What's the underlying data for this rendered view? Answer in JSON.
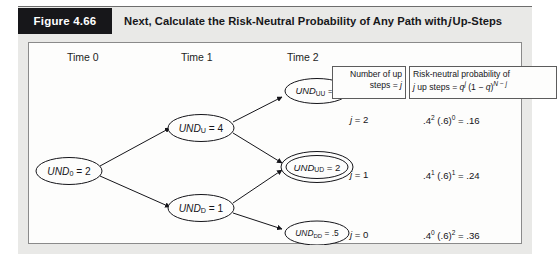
{
  "figure": {
    "tag": "Figure 4.66",
    "title_part1": "Next, Calculate the Risk-Neutral Probability of Any Path with ",
    "title_italic": "j",
    "title_part2": " Up-Steps"
  },
  "tree": {
    "time_labels": [
      {
        "label": "Time 0"
      },
      {
        "label": "Time 1"
      },
      {
        "label": "Time 2"
      }
    ],
    "nodes": [
      {
        "id": "und0",
        "name": "UND",
        "sub": "0",
        "value": "= 2",
        "double": false,
        "small": false
      },
      {
        "id": "undu",
        "name": "UND",
        "sub": "U",
        "value": "= 4",
        "double": false,
        "small": false
      },
      {
        "id": "undd",
        "name": "UND",
        "sub": "D",
        "value": "= 1",
        "double": false,
        "small": false
      },
      {
        "id": "unduu",
        "name": "UND",
        "sub": "UU",
        "value": "= 8",
        "double": false,
        "small": true
      },
      {
        "id": "undud",
        "name": "UND",
        "sub": "UD",
        "value": "= 2",
        "double": true,
        "small": false
      },
      {
        "id": "unddd",
        "name": "UND",
        "sub": "DD",
        "value": "= .5",
        "double": false,
        "small": true
      }
    ]
  },
  "table": {
    "header_j": {
      "line1": "Number of up",
      "line2_pre": "steps = ",
      "line2_var": "j"
    },
    "header_prob": {
      "line1_pre": "Risk-neutral probability of",
      "line2_var1": "j",
      "line2_mid": " up steps = ",
      "line2_q": "q",
      "line2_qsup": "j",
      "line2_tail_open": " (1 − ",
      "line2_q2": "q",
      "line2_tail_close": ")",
      "line2_exp_n": "N",
      "line2_exp_minus": " − ",
      "line2_exp_j": "j"
    },
    "rows": [
      {
        "j_label_pre": "j",
        "j_label_val": " = 2",
        "prob_base1": ".4",
        "prob_exp1": "2",
        "prob_base2": " (.6)",
        "prob_exp2": "0",
        "prob_result": " = .16"
      },
      {
        "j_label_pre": "j",
        "j_label_val": " = 1",
        "prob_base1": ".4",
        "prob_exp1": "1",
        "prob_base2": " (.6)",
        "prob_exp2": "1",
        "prob_result": " = .24"
      },
      {
        "j_label_pre": "j",
        "j_label_val": " = 0",
        "prob_base1": ".4",
        "prob_exp1": "0",
        "prob_base2": " (.6)",
        "prob_exp2": "2",
        "prob_result": " = .36"
      }
    ]
  },
  "colors": {
    "tag_background": "#17171a",
    "band_background": "#e9e9e7",
    "panel_background": "#fdfdfc",
    "border": "#8a8a8a",
    "ink": "#15151a"
  }
}
